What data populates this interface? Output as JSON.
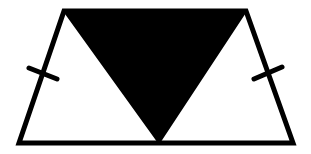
{
  "diagram": {
    "type": "geometry",
    "colors": {
      "stroke": "#000000",
      "fill_shaded": "#000000",
      "background": "#ffffff"
    },
    "trapezoid": {
      "top_left": [
        64,
        11
      ],
      "top_right": [
        246,
        11
      ],
      "bottom_right": [
        293,
        143
      ],
      "bottom_left": [
        19,
        143
      ]
    },
    "shaded_triangle": {
      "points": [
        [
          64,
          11
        ],
        [
          246,
          11
        ],
        [
          159,
          143
        ]
      ]
    },
    "tick_marks": [
      {
        "side": "left-leg",
        "from": [
          29,
          68
        ],
        "to": [
          57,
          79
        ]
      },
      {
        "side": "right-leg",
        "from": [
          254,
          79
        ],
        "to": [
          282,
          67
        ]
      }
    ]
  }
}
